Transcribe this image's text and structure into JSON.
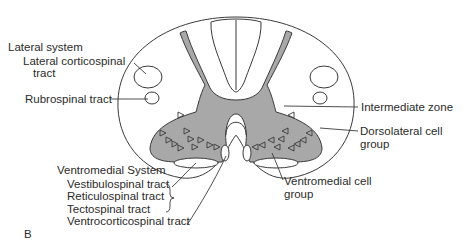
{
  "figure": {
    "panel_label": "B",
    "colors": {
      "gray_matter": "#a8a8a8",
      "outline": "#3a3a3a",
      "background": "#ffffff"
    }
  },
  "labels": {
    "lateral_system": {
      "heading": "Lateral system",
      "items": [
        "Lateral corticospinal",
        "tract",
        "Rubrospinal tract"
      ]
    },
    "right": {
      "intermediate_zone": "Intermediate zone",
      "dorsolateral": [
        "Dorsolateral cell",
        "group"
      ],
      "ventromedial_cell": [
        "Ventromedial cell",
        "group"
      ]
    },
    "ventromedial_system": {
      "heading": "Ventromedial System",
      "items": [
        "Vestibulospinal tract",
        "Reticulospinal tract",
        "Tectospinal tract",
        "Ventrocorticospinal tract"
      ]
    }
  }
}
